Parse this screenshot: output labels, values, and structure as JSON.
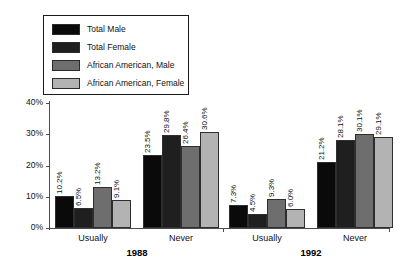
{
  "chart_data": {
    "type": "bar",
    "title": "",
    "subtitle": "",
    "xlabel": "",
    "ylabel": "",
    "ylim": [
      0,
      40
    ],
    "ytick_labels": [
      "0%",
      "10%",
      "20%",
      "30%",
      "40%"
    ],
    "ytick_values": [
      0,
      10,
      20,
      30,
      40
    ],
    "grid": false,
    "legend_position": "top-left",
    "categories": [
      "Usually",
      "Never",
      "Usually",
      "Never"
    ],
    "group_periods": [
      "1988",
      "1992"
    ],
    "series": [
      {
        "name": "Total Male",
        "color": "#0a0a0a",
        "values": [
          10.2,
          23.5,
          7.3,
          21.2
        ],
        "labels": [
          "10.2%",
          "23.5%",
          "7.3%",
          "21.2%"
        ]
      },
      {
        "name": "Total Female",
        "color": "#1f1f1f",
        "values": [
          6.5,
          29.8,
          4.5,
          28.1
        ],
        "labels": [
          "6.5%",
          "29.8%",
          "4.5%",
          "28.1%"
        ]
      },
      {
        "name": "African American, Male",
        "color": "#6e6e6e",
        "values": [
          13.2,
          26.4,
          9.3,
          30.1
        ],
        "labels": [
          "13.2%",
          "26.4%",
          "9.3%",
          "30.1%"
        ]
      },
      {
        "name": "African American, Female",
        "color": "#b3b3b3",
        "values": [
          9.1,
          30.6,
          6.0,
          29.1
        ],
        "labels": [
          "9.1%",
          "30.6%",
          "6.0%",
          "29.1%"
        ]
      }
    ]
  },
  "legend": {
    "items": [
      {
        "label": "Total Male",
        "color": "#0a0a0a"
      },
      {
        "label": "Total Female",
        "color": "#1f1f1f"
      },
      {
        "label": "African American, Male",
        "color": "#6e6e6e"
      },
      {
        "label": "African American, Female",
        "color": "#b3b3b3"
      }
    ]
  },
  "axis": {
    "y_ticks": [
      "0%",
      "10%",
      "20%",
      "30%",
      "40%"
    ],
    "x_categories": [
      "Usually",
      "Never",
      "Usually",
      "Never"
    ],
    "periods": [
      "1988",
      "1992"
    ]
  }
}
